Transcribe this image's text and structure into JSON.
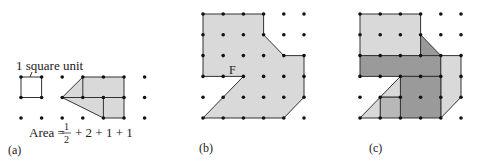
{
  "colors": {
    "light": "#d9d9d9",
    "medium": "#b8b8b8",
    "dark": "#9a9a9a",
    "stroke": "#333333",
    "dot": "#111111"
  },
  "panels": [
    {
      "id": "a",
      "caption": "(a)",
      "unit_label": "1 square unit",
      "area_label": {
        "prefix": "Area =",
        "frac_num": "1",
        "frac_den": "2",
        "rest": "+ 2 + 1 + 1"
      },
      "origin": [
        21,
        77
      ],
      "step": [
        20.6,
        20.5
      ],
      "cols": 7,
      "rows": 3,
      "unit_square": [
        [
          0,
          0
        ],
        [
          1,
          0
        ],
        [
          1,
          1
        ],
        [
          0,
          1
        ]
      ],
      "shape": [
        [
          2,
          1
        ],
        [
          3,
          0
        ],
        [
          5,
          0
        ],
        [
          5,
          2
        ],
        [
          4,
          2
        ]
      ],
      "inner_lines": [
        [
          [
            3,
            0
          ],
          [
            3,
            1
          ]
        ],
        [
          [
            2,
            1
          ],
          [
            5,
            1
          ]
        ],
        [
          [
            4,
            1
          ],
          [
            4,
            2
          ]
        ]
      ]
    },
    {
      "id": "b",
      "caption": "(b)",
      "point_label": "F",
      "origin": [
        203,
        14
      ],
      "step": [
        20.2,
        20.8
      ],
      "cols": 6,
      "rows": 6,
      "shape": [
        [
          0,
          0
        ],
        [
          3,
          0
        ],
        [
          3,
          1
        ],
        [
          4,
          2
        ],
        [
          5,
          2
        ],
        [
          5,
          4
        ],
        [
          4,
          5
        ],
        [
          0,
          5
        ],
        [
          2,
          3
        ],
        [
          0,
          3
        ]
      ]
    },
    {
      "id": "c",
      "caption": "(c)",
      "origin": [
        360,
        14
      ],
      "step": [
        20.2,
        20.8
      ],
      "cols": 6,
      "rows": 6,
      "regions": [
        {
          "tone": "light",
          "pts": [
            [
              0,
              0
            ],
            [
              3,
              0
            ],
            [
              3,
              2
            ],
            [
              0,
              2
            ]
          ]
        },
        {
          "tone": "dark",
          "pts": [
            [
              3,
              1
            ],
            [
              4,
              2
            ],
            [
              3,
              2
            ]
          ]
        },
        {
          "tone": "dark",
          "pts": [
            [
              0,
              2
            ],
            [
              4,
              2
            ],
            [
              4,
              3
            ],
            [
              0,
              3
            ]
          ]
        },
        {
          "tone": "light",
          "pts": [
            [
              4,
              2
            ],
            [
              5,
              2
            ],
            [
              5,
              4
            ],
            [
              4,
              5
            ]
          ]
        },
        {
          "tone": "dark",
          "pts": [
            [
              2,
              3
            ],
            [
              4,
              3
            ],
            [
              4,
              5
            ],
            [
              2,
              5
            ]
          ]
        },
        {
          "tone": "light",
          "pts": [
            [
              2,
              3
            ],
            [
              2,
              4
            ],
            [
              1,
              4
            ]
          ]
        },
        {
          "tone": "medium",
          "pts": [
            [
              1,
              4
            ],
            [
              2,
              4
            ],
            [
              2,
              5
            ],
            [
              1,
              5
            ]
          ]
        },
        {
          "tone": "light",
          "pts": [
            [
              1,
              4
            ],
            [
              1,
              5
            ],
            [
              0,
              5
            ]
          ]
        }
      ]
    }
  ]
}
